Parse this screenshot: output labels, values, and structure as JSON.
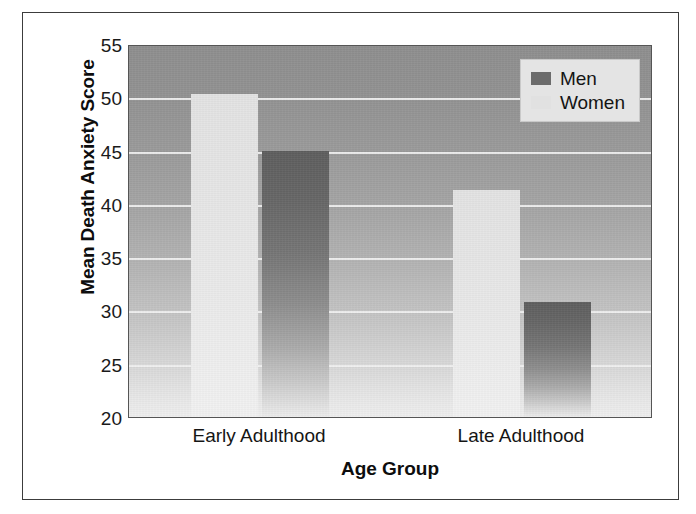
{
  "chart_data": {
    "type": "bar",
    "title": "",
    "xlabel": "Age Group",
    "ylabel": "Mean Death Anxiety Score",
    "categories": [
      "Early Adulthood",
      "Late Adulthood"
    ],
    "series": [
      {
        "name": "Men",
        "values": [
          45.0,
          30.8
        ],
        "color": "#6b6b6b"
      },
      {
        "name": "Women",
        "values": [
          50.3,
          41.3
        ],
        "color": "#e1e1e1"
      }
    ],
    "series_draw_order": [
      "Women",
      "Men"
    ],
    "ylim": [
      20,
      55
    ],
    "yticks": [
      55,
      50,
      45,
      40,
      35,
      30,
      25,
      20
    ],
    "ytick_labels": [
      "55",
      "50",
      "45",
      "40",
      "35",
      "30",
      "25",
      "20"
    ],
    "grid": true,
    "grid_axis": "y",
    "gridline_color": "#f2f2f2",
    "legend_position": "top-right",
    "legend_entries": [
      "Men",
      "Women"
    ],
    "plot_background": "gray-vertical-gradient",
    "frame": true
  },
  "legend": {
    "items": [
      {
        "label": "Men",
        "swatch": "men-swatch-dark"
      },
      {
        "label": "Women",
        "swatch": "women-swatch-light"
      }
    ]
  },
  "axes": {
    "y_title": "Mean Death Anxiety Score",
    "x_title": "Age Group",
    "y_tick_labels": [
      "55",
      "50",
      "45",
      "40",
      "35",
      "30",
      "25",
      "20"
    ],
    "x_tick_labels": [
      "Early Adulthood",
      "Late Adulthood"
    ]
  },
  "bars": [
    {
      "group": "Early Adulthood",
      "series": "Women",
      "value": 50.3
    },
    {
      "group": "Early Adulthood",
      "series": "Men",
      "value": 45.0
    },
    {
      "group": "Late Adulthood",
      "series": "Women",
      "value": 41.3
    },
    {
      "group": "Late Adulthood",
      "series": "Men",
      "value": 30.8
    }
  ]
}
